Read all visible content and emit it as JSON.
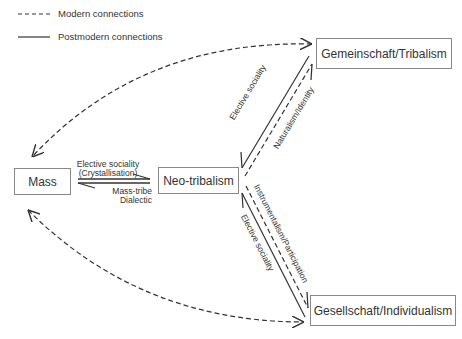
{
  "legend": {
    "modern": "Modern connections",
    "postmodern": "Postmodern connections"
  },
  "nodes": {
    "mass": "Mass",
    "neo_tribalism": "Neo-tribalism",
    "gemeinschaft": "Gemeinschaft/Tribalism",
    "gesellschaft": "Gesellschaft/Individualism"
  },
  "edge_labels": {
    "mass_to_neo_line1": "Elective sociality",
    "mass_to_neo_line2": "(Crystallisation)",
    "neo_to_mass_line1": "Mass-tribe",
    "neo_to_mass_line2": "Dialectic",
    "neo_gem_elective": "Elective sociality",
    "neo_gem_naturalism": "Naturalism/Identity",
    "neo_ges_instrumentalism": "Instrumentalism/Participation",
    "neo_ges_elective": "Elective sociality"
  },
  "colors": {
    "line": "#333333",
    "box_border": "#888888"
  }
}
